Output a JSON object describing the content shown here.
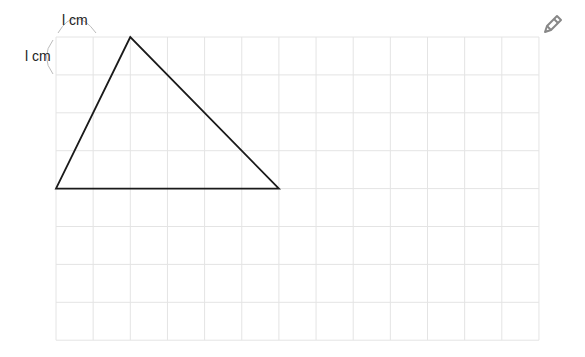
{
  "grid": {
    "left": 56,
    "top": 37,
    "cols": 13,
    "rows": 8,
    "cell_w": 37.15,
    "cell_h": 37.9,
    "line_color": "#e4e4e4"
  },
  "labels": {
    "top_unit": "l cm",
    "left_unit": "l cm"
  },
  "triangle": {
    "vertices_grid": [
      [
        2,
        0
      ],
      [
        0,
        4
      ],
      [
        6,
        4
      ]
    ],
    "stroke": "#1a1a1a"
  },
  "icon": {
    "name": "pencil-icon",
    "color": "#888888"
  }
}
